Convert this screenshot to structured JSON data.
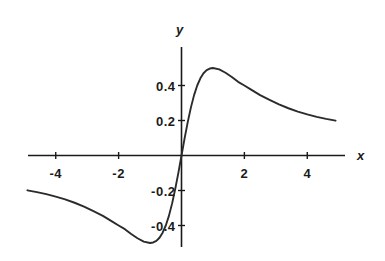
{
  "chart_data": {
    "type": "line",
    "title": "",
    "subtitle": "",
    "xlabel": "x",
    "ylabel": "y",
    "xlim": [
      -5.2,
      5.2
    ],
    "ylim": [
      -0.62,
      0.62
    ],
    "grid": false,
    "legend": null,
    "xticks": [
      -4,
      -2,
      2,
      4
    ],
    "xtick_labels": [
      "-4",
      "-2",
      "2",
      "4"
    ],
    "yticks": [
      0.4,
      0.2,
      -0.2,
      -0.4
    ],
    "ytick_labels": [
      "0.4",
      "0.2",
      "-0.2",
      "-0.4"
    ],
    "axis_color": "#1a1a1a",
    "curve_color": "#2b2b2b",
    "background": "#ffffff",
    "series": [
      {
        "name": "curve",
        "x": [
          -4.9,
          -4.6,
          -4.3,
          -4.0,
          -3.7,
          -3.4,
          -3.1,
          -2.8,
          -2.5,
          -2.2,
          -2.0,
          -1.8,
          -1.6,
          -1.4,
          -1.2,
          -1.0,
          -0.9,
          -0.8,
          -0.7,
          -0.6,
          -0.5,
          -0.4,
          -0.3,
          -0.2,
          -0.1,
          0.0,
          0.1,
          0.2,
          0.3,
          0.4,
          0.5,
          0.6,
          0.7,
          0.8,
          0.9,
          1.0,
          1.2,
          1.4,
          1.6,
          1.8,
          2.0,
          2.2,
          2.5,
          2.8,
          3.1,
          3.4,
          3.7,
          4.0,
          4.3,
          4.6,
          4.9
        ],
        "y": [
          -0.199,
          -0.209,
          -0.221,
          -0.235,
          -0.251,
          -0.27,
          -0.292,
          -0.318,
          -0.345,
          -0.378,
          -0.4,
          -0.421,
          -0.449,
          -0.473,
          -0.492,
          -0.5,
          -0.497,
          -0.488,
          -0.47,
          -0.441,
          -0.4,
          -0.345,
          -0.275,
          -0.192,
          -0.099,
          0.0,
          0.099,
          0.192,
          0.275,
          0.345,
          0.4,
          0.441,
          0.47,
          0.488,
          0.497,
          0.5,
          0.492,
          0.473,
          0.449,
          0.421,
          0.4,
          0.378,
          0.345,
          0.318,
          0.292,
          0.27,
          0.251,
          0.235,
          0.221,
          0.209,
          0.199
        ]
      }
    ],
    "annotations": []
  }
}
